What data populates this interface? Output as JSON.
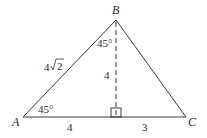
{
  "diagram": {
    "type": "triangle-with-altitude",
    "colors": {
      "stroke": "#3a3a3a",
      "text": "#2a2a2a",
      "background": "#ffffff"
    },
    "vertices": {
      "A": {
        "label": "A",
        "x": 23,
        "y": 117
      },
      "B": {
        "label": "B",
        "x": 116,
        "y": 20
      },
      "C": {
        "label": "C",
        "x": 186,
        "y": 117
      },
      "D": {
        "x": 116,
        "y": 117
      }
    },
    "labels": {
      "angle_B": "45°",
      "angle_A": "45°",
      "side_AB": "4√2",
      "side_AB_coef": "4",
      "side_AB_radicand": "2",
      "altitude_BD": "4",
      "segment_AD": "4",
      "segment_DC": "3"
    },
    "right_angle_marker": {
      "at": "D",
      "size": 10
    }
  }
}
